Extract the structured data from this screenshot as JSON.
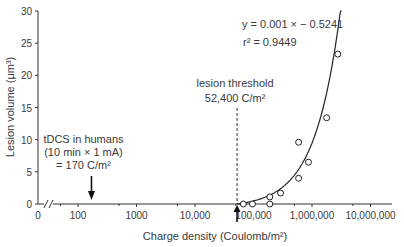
{
  "chart_data": {
    "type": "scatter",
    "title": "",
    "xlabel": "Charge density  (Coulomb/m²)",
    "ylabel": "Lesion volume (μm³)",
    "xscale": "log",
    "xlim": [
      20,
      10000000
    ],
    "ylim": [
      0,
      30
    ],
    "x_ticks": [
      {
        "value": 0,
        "label": "0"
      },
      {
        "value": 100,
        "label": "100"
      },
      {
        "value": 1000,
        "label": "1000"
      },
      {
        "value": 10000,
        "label": "10,000"
      },
      {
        "value": 100000,
        "label": "100,000"
      },
      {
        "value": 1000000,
        "label": "1,000,000"
      },
      {
        "value": 10000000,
        "label": "10,000,000"
      }
    ],
    "y_ticks": [
      0,
      5,
      10,
      15,
      20,
      25,
      30
    ],
    "grid": false,
    "axis_break": true,
    "series": [
      {
        "name": "Lesion volume",
        "marker": "open-circle",
        "points": [
          {
            "x": 67000,
            "y": 0
          },
          {
            "x": 96000,
            "y": 0
          },
          {
            "x": 190000,
            "y": 0
          },
          {
            "x": 190000,
            "y": 1.1
          },
          {
            "x": 290000,
            "y": 1.7
          },
          {
            "x": 590000,
            "y": 4.0
          },
          {
            "x": 590000,
            "y": 9.6
          },
          {
            "x": 870000,
            "y": 6.5
          },
          {
            "x": 1780000,
            "y": 13.4
          },
          {
            "x": 2760000,
            "y": 23.3
          }
        ]
      }
    ],
    "fit": {
      "type": "linear",
      "slope": 1e-05,
      "intercept": -0.5241,
      "equation_label": "y = 0.001 × − 0.5241",
      "r2_label": "r² = 0.9449",
      "x_range": [
        52400,
        3200000
      ]
    },
    "annotations": [
      {
        "name": "lesion-threshold",
        "lines": [
          "lesion threshold",
          "52,400 C/m²"
        ],
        "x": 52400,
        "style": "dashed-vertical-line-with-arrow"
      },
      {
        "name": "tdcs-humans",
        "lines": [
          "tDCS in humans",
          "(10 min × 1 mA)",
          "= 170 C/m²"
        ],
        "x": 170,
        "style": "arrow-down"
      }
    ]
  }
}
